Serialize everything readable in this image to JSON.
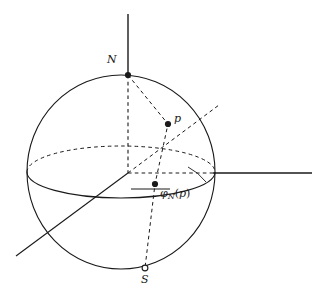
{
  "figure": {
    "kind": "geometry-diagram",
    "background_color": "#ffffff",
    "stroke_color": "#1a1a1a",
    "labels": {
      "north_pole": "N",
      "south_pole": "S",
      "point": "p",
      "projection_symbol": "φ",
      "projection_subscript": "N",
      "projection_open_paren": "(",
      "projection_argument": "p",
      "projection_close_paren": ")"
    },
    "points": {
      "north_pole": {
        "x": 128,
        "y": 75,
        "style": "filled-dot"
      },
      "south_pole": {
        "x": 145,
        "y": 268,
        "style": "open-dot"
      },
      "p": {
        "x": 168,
        "y": 124,
        "style": "filled-dot"
      },
      "phi_N_p": {
        "x": 155,
        "y": 184,
        "style": "filled-dot"
      },
      "origin": {
        "x": 128,
        "y": 173,
        "style": "none"
      }
    },
    "sphere": {
      "center_x": 121,
      "center_y": 172,
      "radius_x": 94,
      "radius_y": 97
    },
    "equator": {
      "center_x": 121,
      "center_y": 172,
      "radius_x": 94,
      "radius_y": 26,
      "front_style": "solid",
      "back_style": "dashed"
    },
    "axes": {
      "vertical": {
        "x1": 128,
        "y1": 14,
        "x2": 128,
        "y2": 173,
        "style": "solid"
      },
      "horizontal_right": {
        "x1": 213,
        "y1": 173,
        "x2": 312,
        "y2": 173,
        "style": "solid"
      },
      "diagonal": {
        "x1": 16,
        "y1": 256,
        "x2": 128,
        "y2": 173,
        "style": "solid"
      }
    }
  }
}
